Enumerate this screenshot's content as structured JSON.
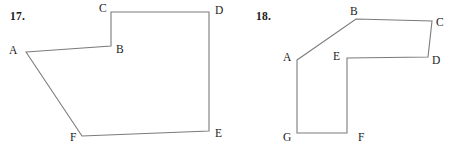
{
  "page": {
    "background_color": "#ffffff",
    "stroke_color": "#7b7b7b",
    "text_color": "#1a1a1a",
    "width": 454,
    "height": 154
  },
  "figures": [
    {
      "number_label": "17.",
      "number_pos": {
        "x": 10,
        "y": 10
      },
      "shape": "hexagon",
      "path": "M 26 52 L 111 46 L 111 12 L 209 12 L 209 131 L 82 136 Z",
      "vertices": [
        {
          "name": "A",
          "x": 26,
          "y": 52,
          "label": "A",
          "label_x": 9,
          "label_y": 45
        },
        {
          "name": "B",
          "x": 111,
          "y": 46,
          "label": "B",
          "label_x": 116,
          "label_y": 44
        },
        {
          "name": "C",
          "x": 111,
          "y": 12,
          "label": "C",
          "label_x": 99,
          "label_y": 3
        },
        {
          "name": "D",
          "x": 209,
          "y": 12,
          "label": "D",
          "label_x": 215,
          "label_y": 5
        },
        {
          "name": "E",
          "x": 209,
          "y": 131,
          "label": "E",
          "label_x": 215,
          "label_y": 128
        },
        {
          "name": "F",
          "x": 82,
          "y": 136,
          "label": "F",
          "label_x": 70,
          "label_y": 132
        }
      ]
    },
    {
      "number_label": "18.",
      "number_pos": {
        "x": 256,
        "y": 10
      },
      "shape": "heptagon",
      "path": "M 297 60 L 356 19 L 432 21 L 428 57 L 347 58 L 347 133 L 297 133 Z",
      "vertices": [
        {
          "name": "A",
          "x": 297,
          "y": 60,
          "label": "A",
          "label_x": 283,
          "label_y": 52
        },
        {
          "name": "B",
          "x": 356,
          "y": 19,
          "label": "B",
          "label_x": 350,
          "label_y": 6
        },
        {
          "name": "C",
          "x": 432,
          "y": 21,
          "label": "C",
          "label_x": 436,
          "label_y": 17
        },
        {
          "name": "D",
          "x": 428,
          "y": 57,
          "label": "D",
          "label_x": 432,
          "label_y": 55
        },
        {
          "name": "E",
          "x": 347,
          "y": 58,
          "label": "E",
          "label_x": 333,
          "label_y": 51
        },
        {
          "name": "F",
          "x": 347,
          "y": 133,
          "label": "F",
          "label_x": 358,
          "label_y": 132
        },
        {
          "name": "G",
          "x": 297,
          "y": 133,
          "label": "G",
          "label_x": 283,
          "label_y": 132
        }
      ]
    }
  ]
}
